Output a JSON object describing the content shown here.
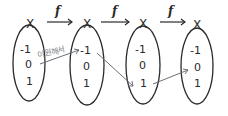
{
  "diagram": {
    "sets": [
      {
        "name": "X",
        "elements": [
          "-1",
          "0",
          "1"
        ]
      },
      {
        "name": "X",
        "elements": [
          "-1",
          "0",
          "1"
        ]
      },
      {
        "name": "X",
        "elements": [
          "-1",
          "0",
          "1"
        ]
      },
      {
        "name": "X",
        "elements": [
          "-1",
          "0",
          "1"
        ]
      }
    ],
    "maps": [
      {
        "label": "f",
        "from": 0,
        "to": 1
      },
      {
        "label": "f",
        "from": 1,
        "to": 2
      },
      {
        "label": "f",
        "from": 2,
        "to": 3
      }
    ],
    "arrows": [
      {
        "from": "set0:0",
        "to": "set1:-1"
      },
      {
        "from": "set1:-1",
        "to": "set2:1"
      },
      {
        "from": "set2:1",
        "to": "set3:0"
      }
    ],
    "annotation": "이원해서",
    "colors": {
      "ink": "#2a2a2a",
      "arrow": "#6b6f78",
      "annotation": "#7a7f8a"
    }
  }
}
